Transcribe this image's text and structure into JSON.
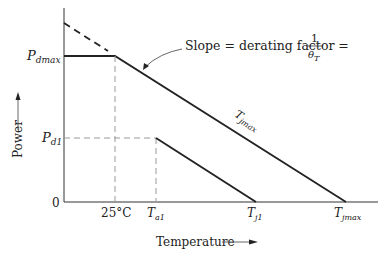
{
  "diagram": {
    "type": "power-derating-curve",
    "axes": {
      "y_label": "Power",
      "x_label": "Temperature",
      "origin_label": "0"
    },
    "y_ticks": {
      "pdmax": {
        "main": "P",
        "sub": "dmax"
      },
      "pd1": {
        "main": "P",
        "sub": "d1"
      }
    },
    "x_ticks": {
      "t25": "25°C",
      "ta1": {
        "main": "T",
        "sub": "a1"
      },
      "tj1": {
        "main": "T",
        "sub": "j1"
      },
      "tjmax": {
        "main": "T",
        "sub": "jmax"
      }
    },
    "annotations": {
      "slope_text": "Slope = derating factor =",
      "fraction_num": "1",
      "fraction_den_main": "θ",
      "fraction_den_sub": "T",
      "line_label_main": "T",
      "line_label_sub": "jmax"
    },
    "colors": {
      "line": "#222222",
      "dashed": "#888888",
      "axis": "#333333"
    }
  }
}
